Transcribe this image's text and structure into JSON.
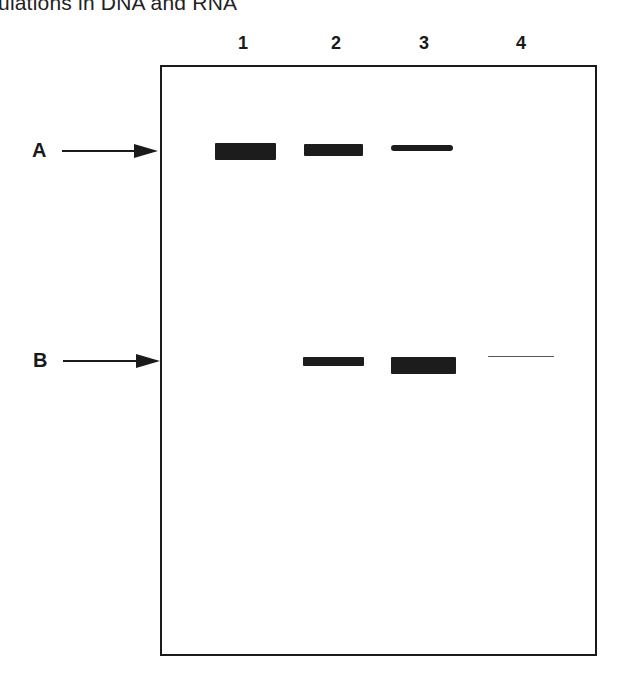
{
  "caption": "ulations in DNA and RNA",
  "lanes": [
    {
      "label": "1",
      "x": 243
    },
    {
      "label": "2",
      "x": 336
    },
    {
      "label": "3",
      "x": 424
    },
    {
      "label": "4",
      "x": 521
    }
  ],
  "markers": [
    {
      "label": "A",
      "y": 151
    },
    {
      "label": "B",
      "y": 361
    }
  ],
  "bands": [
    {
      "marker": "A",
      "lane": "1",
      "x": 215,
      "y": 143,
      "w": 61,
      "h": 17,
      "intensity": "strong"
    },
    {
      "marker": "A",
      "lane": "2",
      "x": 304,
      "y": 144,
      "w": 59,
      "h": 12,
      "intensity": "medium"
    },
    {
      "marker": "A",
      "lane": "3",
      "x": 391,
      "y": 145,
      "w": 62,
      "h": 6,
      "intensity": "weak"
    },
    {
      "marker": "B",
      "lane": "2",
      "x": 303,
      "y": 357,
      "w": 61,
      "h": 9,
      "intensity": "medium"
    },
    {
      "marker": "B",
      "lane": "3",
      "x": 391,
      "y": 357,
      "w": 65,
      "h": 17,
      "intensity": "strong"
    },
    {
      "marker": "B",
      "lane": "4",
      "x": 488,
      "y": 356,
      "w": 66,
      "h": 2,
      "intensity": "faint"
    }
  ],
  "colors": {
    "band": "#1c1c1c",
    "frame": "#1a1a1a",
    "background": "#ffffff"
  }
}
